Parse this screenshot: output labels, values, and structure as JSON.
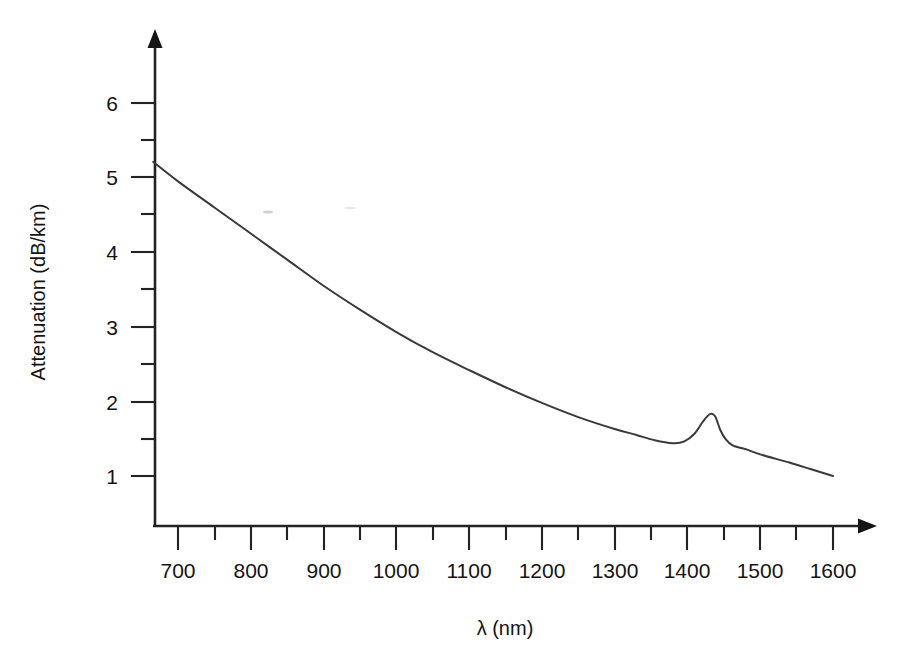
{
  "figure": {
    "background_color": "#ffffff",
    "line_color": "#3a3a3a",
    "axis_color": "#232323"
  },
  "axes": {
    "x_title": "λ (nm)",
    "y_title": "Attenuation (dB/km)"
  },
  "chart_data": {
    "type": "line",
    "title": "",
    "subtitle": "",
    "xlabel": "λ (nm)",
    "ylabel": "Attenuation (dB/km)",
    "xlim": [
      666,
      1620
    ],
    "ylim": [
      0.33,
      6.6
    ],
    "grid": false,
    "legend": null,
    "legend_position": "none",
    "x_ticks_major": [
      700,
      800,
      900,
      1000,
      1100,
      1200,
      1300,
      1400,
      1500,
      1600
    ],
    "x_tick_labels": [
      "700",
      "800",
      "900",
      "1000",
      "1100",
      "1200",
      "1300",
      "1400",
      "1500",
      "1600"
    ],
    "x_ticks_minor": [
      750,
      850,
      950,
      1050,
      1150,
      1250,
      1350,
      1450,
      1550
    ],
    "y_ticks_major": [
      1,
      2,
      3,
      4,
      5,
      6
    ],
    "y_tick_labels": [
      "1",
      "2",
      "3",
      "4",
      "5",
      "6"
    ],
    "y_ticks_minor": [
      1.5,
      2.5,
      3.5,
      4.5,
      5.5
    ],
    "series": [
      {
        "name": "Silica fiber attenuation",
        "x": [
          666,
          700,
          750,
          800,
          850,
          900,
          950,
          1000,
          1050,
          1100,
          1150,
          1200,
          1250,
          1300,
          1330,
          1355,
          1380,
          1395,
          1410,
          1422,
          1431,
          1438,
          1445,
          1452,
          1462,
          1480,
          1500,
          1540,
          1570,
          1600
        ],
        "y": [
          5.21,
          4.95,
          4.6,
          4.25,
          3.9,
          3.55,
          3.23,
          2.93,
          2.66,
          2.42,
          2.19,
          1.98,
          1.79,
          1.63,
          1.55,
          1.48,
          1.44,
          1.46,
          1.57,
          1.74,
          1.83,
          1.8,
          1.62,
          1.5,
          1.41,
          1.36,
          1.29,
          1.18,
          1.09,
          1.0
        ]
      }
    ],
    "annotations": [
      {
        "label": "water absorption peak",
        "x": 1431,
        "y": 1.83
      },
      {
        "label": "loss minimum window",
        "x": 1380,
        "y": 1.44
      }
    ]
  }
}
